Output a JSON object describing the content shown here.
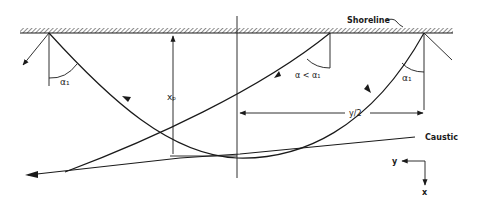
{
  "diagram": {
    "type": "ray-refraction-caustic",
    "labels": {
      "shoreline": "Shoreline",
      "caustic": "Caustic",
      "alpha_left": "α₁",
      "alpha_mid": "α < α₁",
      "alpha_right": "α₁",
      "xp": "xₚ",
      "half_y": "y/2",
      "axis_y": "y",
      "axis_x": "x"
    },
    "colors": {
      "ink": "#1a1a1a",
      "background": "#ffffff"
    }
  }
}
